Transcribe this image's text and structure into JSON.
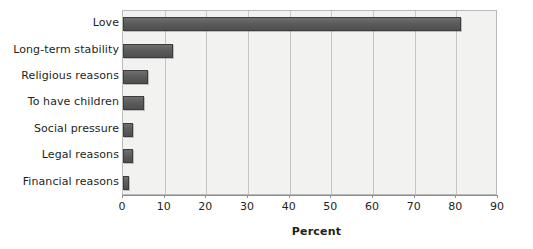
{
  "chart_data": {
    "type": "bar",
    "orientation": "horizontal",
    "title": "",
    "subtitle": "",
    "xlabel": "Percent",
    "ylabel": "",
    "categories": [
      "Love",
      "Long-term stability",
      "Religious reasons",
      "To have children",
      "Social pressure",
      "Legal reasons",
      "Financial reasons"
    ],
    "values": [
      81,
      12,
      6,
      5,
      2.5,
      2.5,
      1.5
    ],
    "series": [
      {
        "name": "Percent",
        "values": [
          81,
          12,
          6,
          5,
          2.5,
          2.5,
          1.5
        ]
      }
    ],
    "xlim": [
      0,
      90
    ],
    "xticks": [
      0,
      10,
      20,
      30,
      40,
      50,
      60,
      70,
      80,
      90
    ],
    "xtick_labels": [
      "0",
      "10",
      "20",
      "30",
      "40",
      "50",
      "60",
      "70",
      "80",
      "90"
    ],
    "grid": "vertical",
    "legend": "none",
    "annotations": [],
    "colors": {
      "bar_fill": "#5c5c5c",
      "bar_edge": "#3d3d3d",
      "plot_background": "#f2f2f0",
      "plot_border": "#b9b9b7",
      "gridline": "#c6c6c4",
      "text": "#231f20",
      "axis_line": "#8e8e8c"
    }
  }
}
